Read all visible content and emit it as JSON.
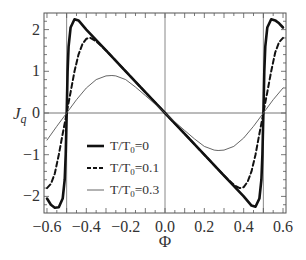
{
  "chart_data": {
    "type": "line",
    "title": "",
    "xlabel": "Φ",
    "ylabel": "J_q",
    "xlim": [
      -0.62,
      0.61
    ],
    "ylim": [
      -2.4,
      2.4
    ],
    "xticks": [
      -0.6,
      -0.4,
      -0.2,
      0.0,
      0.2,
      0.4,
      0.6
    ],
    "xtick_labels": [
      "−0.6",
      "−0.4",
      "−0.2",
      "0.0",
      "0.2",
      "0.4",
      "0.6"
    ],
    "yticks": [
      -2,
      -1,
      0,
      1,
      2
    ],
    "ytick_labels": [
      "−2",
      "−1",
      "0",
      "1",
      "2"
    ],
    "grid": false,
    "reference_lines": {
      "horizontal": [
        0
      ],
      "vertical": [
        -0.5,
        0.0,
        0.5
      ]
    },
    "legend": {
      "position": "lower-left-center",
      "entries": [
        {
          "label_main": "T/T",
          "label_sub": "0",
          "label_rest": "=0",
          "style": "solid-thick"
        },
        {
          "label_main": "T/T",
          "label_sub": "0",
          "label_rest": "=0.1",
          "style": "dashed"
        },
        {
          "label_main": "T/T",
          "label_sub": "0",
          "label_rest": "=0.3",
          "style": "solid-thin"
        }
      ]
    },
    "series": [
      {
        "name": "T/T0=0",
        "style": "solid-thick",
        "x": [
          -0.6,
          -0.58,
          -0.56,
          -0.54,
          -0.52,
          -0.51,
          -0.505,
          -0.5,
          -0.495,
          -0.49,
          -0.48,
          -0.46,
          -0.44,
          -0.4,
          -0.3,
          -0.2,
          -0.1,
          0.0,
          0.1,
          0.2,
          0.3,
          0.4,
          0.44,
          0.46,
          0.48,
          0.49,
          0.495,
          0.5,
          0.505,
          0.51,
          0.52,
          0.54,
          0.56,
          0.58,
          0.6
        ],
        "y": [
          -2.05,
          -2.2,
          -2.27,
          -2.26,
          -2.05,
          -1.6,
          -1.0,
          0.0,
          1.0,
          1.6,
          2.05,
          2.25,
          2.22,
          2.0,
          1.5,
          1.0,
          0.5,
          0.0,
          -0.5,
          -1.0,
          -1.5,
          -2.0,
          -2.22,
          -2.25,
          -2.05,
          -1.6,
          -1.0,
          0.0,
          1.0,
          1.6,
          2.05,
          2.25,
          2.22,
          2.15,
          2.05
        ]
      },
      {
        "name": "T/T0=0.1",
        "style": "dashed",
        "x": [
          -0.6,
          -0.58,
          -0.56,
          -0.54,
          -0.52,
          -0.51,
          -0.5,
          -0.49,
          -0.48,
          -0.46,
          -0.44,
          -0.42,
          -0.4,
          -0.38,
          -0.36,
          -0.34,
          -0.3,
          -0.2,
          -0.1,
          0.0,
          0.1,
          0.2,
          0.3,
          0.34,
          0.36,
          0.38,
          0.4,
          0.42,
          0.44,
          0.46,
          0.48,
          0.49,
          0.5,
          0.51,
          0.52,
          0.54,
          0.56,
          0.58,
          0.6
        ],
        "y": [
          -1.8,
          -1.7,
          -1.45,
          -1.0,
          -0.5,
          -0.25,
          0.0,
          0.25,
          0.5,
          1.0,
          1.4,
          1.65,
          1.78,
          1.8,
          1.75,
          1.68,
          1.5,
          1.0,
          0.5,
          0.0,
          -0.5,
          -1.0,
          -1.5,
          -1.68,
          -1.75,
          -1.8,
          -1.78,
          -1.65,
          -1.4,
          -1.0,
          -0.5,
          -0.25,
          0.0,
          0.25,
          0.5,
          1.0,
          1.45,
          1.7,
          1.8
        ]
      },
      {
        "name": "T/T0=0.3",
        "style": "solid-thin",
        "x": [
          -0.6,
          -0.55,
          -0.5,
          -0.45,
          -0.4,
          -0.35,
          -0.3,
          -0.27,
          -0.25,
          -0.2,
          -0.15,
          -0.1,
          -0.05,
          0.0,
          0.05,
          0.1,
          0.15,
          0.2,
          0.25,
          0.27,
          0.3,
          0.35,
          0.4,
          0.45,
          0.5,
          0.55,
          0.6
        ],
        "y": [
          -0.65,
          -0.32,
          0.0,
          0.32,
          0.6,
          0.8,
          0.89,
          0.9,
          0.89,
          0.8,
          0.62,
          0.42,
          0.21,
          0.0,
          -0.21,
          -0.42,
          -0.62,
          -0.8,
          -0.89,
          -0.9,
          -0.89,
          -0.8,
          -0.6,
          -0.32,
          0.0,
          0.32,
          0.6
        ]
      }
    ]
  }
}
